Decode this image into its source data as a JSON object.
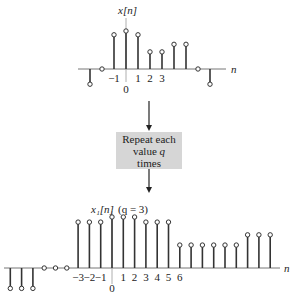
{
  "top_plot": {
    "label_main": "x[n]",
    "axis_label": "n",
    "tick_labels": [
      {
        "n": -1,
        "text": "−1"
      },
      {
        "n": 0,
        "text": "0"
      },
      {
        "n": 1,
        "text": "1"
      },
      {
        "n": 2,
        "text": "2"
      },
      {
        "n": 3,
        "text": "3"
      }
    ],
    "samples": [
      {
        "n": -3,
        "value": -0.4
      },
      {
        "n": -2,
        "value": 0
      },
      {
        "n": -1,
        "value": 0.9
      },
      {
        "n": 0,
        "value": 1.0
      },
      {
        "n": 1,
        "value": 0.9
      },
      {
        "n": 2,
        "value": 0.45
      },
      {
        "n": 3,
        "value": 0.45
      },
      {
        "n": 4,
        "value": 0.65
      },
      {
        "n": 5,
        "value": 0.65
      },
      {
        "n": 6,
        "value": 0
      },
      {
        "n": 7,
        "value": -0.4
      }
    ]
  },
  "process_box": {
    "line1": "Repeat each",
    "line2_prefix": "value ",
    "line2_var": "q",
    "line3": "times"
  },
  "bottom_plot": {
    "label_main": "x₁[n]",
    "label_param": "(q = 3)",
    "axis_label": "n",
    "q": 3,
    "tick_labels": [
      {
        "n": -3,
        "text": "−3"
      },
      {
        "n": -2,
        "text": "−2"
      },
      {
        "n": -1,
        "text": "−1"
      },
      {
        "n": 0,
        "text": "0"
      },
      {
        "n": 1,
        "text": "1"
      },
      {
        "n": 2,
        "text": "2"
      },
      {
        "n": 3,
        "text": "3"
      },
      {
        "n": 4,
        "text": "4"
      },
      {
        "n": 5,
        "text": "5"
      },
      {
        "n": 6,
        "text": "6"
      }
    ],
    "samples": [
      {
        "n": -9,
        "value": -0.4
      },
      {
        "n": -8,
        "value": -0.4
      },
      {
        "n": -7,
        "value": -0.4
      },
      {
        "n": -6,
        "value": 0
      },
      {
        "n": -5,
        "value": 0
      },
      {
        "n": -4,
        "value": 0
      },
      {
        "n": -3,
        "value": 0.9
      },
      {
        "n": -2,
        "value": 0.9
      },
      {
        "n": -1,
        "value": 0.9
      },
      {
        "n": 0,
        "value": 1.0
      },
      {
        "n": 1,
        "value": 1.0
      },
      {
        "n": 2,
        "value": 1.0
      },
      {
        "n": 3,
        "value": 0.9
      },
      {
        "n": 4,
        "value": 0.9
      },
      {
        "n": 5,
        "value": 0.9
      },
      {
        "n": 6,
        "value": 0.45
      },
      {
        "n": 7,
        "value": 0.45
      },
      {
        "n": 8,
        "value": 0.45
      },
      {
        "n": 9,
        "value": 0.45
      },
      {
        "n": 10,
        "value": 0.45
      },
      {
        "n": 11,
        "value": 0.45
      },
      {
        "n": 12,
        "value": 0.65
      },
      {
        "n": 13,
        "value": 0.65
      },
      {
        "n": 14,
        "value": 0.65
      }
    ]
  }
}
